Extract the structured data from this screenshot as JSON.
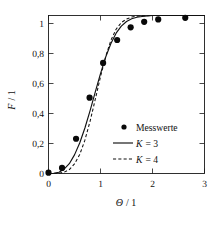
{
  "chart_data": {
    "type": "line",
    "title": "",
    "xlabel": "Θ / 1",
    "ylabel": "F / 1",
    "xlim": [
      0,
      3
    ],
    "ylim": [
      0,
      1.05
    ],
    "xticks": [
      0,
      1,
      2,
      3
    ],
    "xticklabels": [
      "0",
      "1",
      "2",
      "3"
    ],
    "yticks": [
      0,
      0.2,
      0.4,
      0.6,
      0.8,
      1
    ],
    "yticklabels": [
      "0",
      "0,2",
      "0,4",
      "0,6",
      "0,8",
      "1"
    ],
    "grid": false,
    "legend_position": "lower right",
    "decimal_separator": ",",
    "series": [
      {
        "name": "Messwerte",
        "type": "scatter",
        "marker": "filled-circle",
        "color": "#090909",
        "x": [
          0.0,
          0.26,
          0.53,
          0.79,
          1.05,
          1.32,
          1.58,
          1.84,
          2.11,
          2.63
        ],
        "y": [
          0.005,
          0.035,
          0.22,
          0.48,
          0.7,
          0.845,
          0.925,
          0.96,
          0.975,
          0.985
        ]
      },
      {
        "name": "K = 3",
        "type": "line",
        "style": "solid",
        "color": "#111111",
        "x": [
          0.0,
          0.1,
          0.2,
          0.3,
          0.4,
          0.5,
          0.6,
          0.7,
          0.8,
          0.9,
          1.0,
          1.1,
          1.2,
          1.3,
          1.4,
          1.5,
          1.6,
          1.7,
          1.8,
          1.9,
          2.0,
          2.2,
          2.4,
          2.6,
          2.8,
          3.0
        ],
        "y": [
          0.0,
          0.001,
          0.008,
          0.027,
          0.062,
          0.118,
          0.193,
          0.288,
          0.398,
          0.516,
          0.632,
          0.737,
          0.823,
          0.888,
          0.933,
          0.962,
          0.979,
          0.989,
          0.994,
          0.997,
          0.9997,
          0.9999,
          1.0,
          1.0,
          1.0,
          1.0
        ]
      },
      {
        "name": "K = 4",
        "type": "line",
        "style": "dashed",
        "color": "#111111",
        "x": [
          0.0,
          0.1,
          0.2,
          0.3,
          0.4,
          0.5,
          0.6,
          0.7,
          0.8,
          0.9,
          1.0,
          1.1,
          1.2,
          1.3,
          1.4,
          1.5,
          1.6,
          1.7,
          1.8,
          1.9,
          2.0,
          2.2,
          2.4,
          2.6,
          2.8,
          3.0
        ],
        "y": [
          0.0,
          0.0001,
          0.0016,
          0.008,
          0.025,
          0.061,
          0.12,
          0.211,
          0.331,
          0.47,
          0.613,
          0.741,
          0.843,
          0.913,
          0.955,
          0.978,
          0.99,
          0.996,
          0.998,
          0.999,
          1.0,
          1.0,
          1.0,
          1.0,
          1.0,
          1.0
        ]
      }
    ],
    "legend": [
      {
        "label": "Messwerte",
        "marker": "dot"
      },
      {
        "label": "K = 3",
        "marker": "solid-line",
        "symbol": "K",
        "value": "3"
      },
      {
        "label": "K = 4",
        "marker": "dashed-line",
        "symbol": "K",
        "value": "4"
      }
    ]
  },
  "legend_labels": {
    "messwerte": "Messwerte",
    "k_symbol": "K",
    "k3_rest": "= 3",
    "k4_rest": "= 4"
  },
  "axis_titles": {
    "y_symbol": "F",
    "y_rest": "/ 1",
    "x_symbol": "Θ",
    "x_rest": "/ 1"
  },
  "colors": {
    "ink": "#111111",
    "marker": "#090909",
    "background": "#ffffff"
  }
}
